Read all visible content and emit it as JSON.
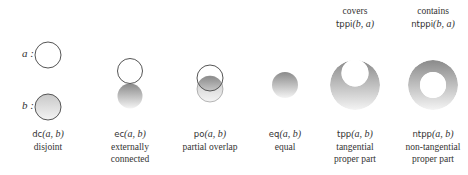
{
  "side_labels": {
    "a": "a :",
    "b": "b :"
  },
  "relations": [
    {
      "id": "dc",
      "name": "dc",
      "args": "(a, b)",
      "desc_line1": "disjoint",
      "desc_line2": ""
    },
    {
      "id": "ec",
      "name": "ec",
      "args": "(a, b)",
      "desc_line1": "externally",
      "desc_line2": "connected"
    },
    {
      "id": "po",
      "name": "po",
      "args": "(a, b)",
      "desc_line1": "partial overlap",
      "desc_line2": ""
    },
    {
      "id": "eq",
      "name": "eq",
      "args": "(a, b)",
      "desc_line1": "equal",
      "desc_line2": ""
    },
    {
      "id": "tpp",
      "name": "tpp",
      "args": "(a, b)",
      "desc_line1": "tangential",
      "desc_line2": "proper part"
    },
    {
      "id": "ntpp",
      "name": "ntpp",
      "args": "(a, b)",
      "desc_line1": "non-tangential",
      "desc_line2": "proper part"
    }
  ],
  "inverses": [
    {
      "id": "tppi",
      "caption": "covers",
      "name": "tppi",
      "args": "(b, a)"
    },
    {
      "id": "ntppi",
      "caption": "contains",
      "name": "ntppi",
      "args": "(b, a)"
    }
  ],
  "colors": {
    "stroke": "#555555",
    "fill_dark": "#8a8a8a",
    "fill_light": "#f4f4f4"
  }
}
